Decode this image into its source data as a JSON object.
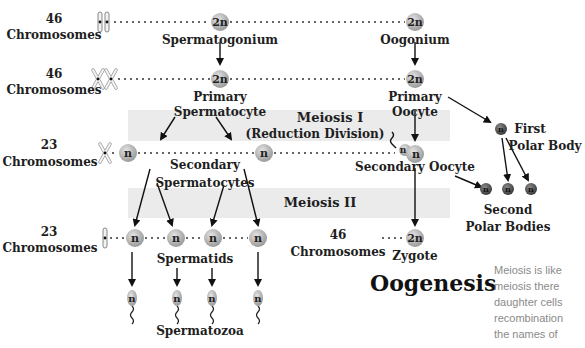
{
  "diagram": {
    "title": "Oogenesis",
    "rows": [
      {
        "count": "46",
        "unit": "Chromosomes"
      },
      {
        "count": "46",
        "unit": "Chromosomes"
      },
      {
        "count": "23",
        "unit": "Chromosomes"
      },
      {
        "count": "23",
        "unit": "Chromosomes"
      }
    ],
    "zygote_row": {
      "count": "46",
      "unit": "Chromosomes"
    },
    "bands": {
      "meiosis1_line1": "Meiosis I",
      "meiosis1_line2": "(Reduction Division)",
      "meiosis2": "Meiosis II"
    },
    "cells": {
      "diploid": "2n",
      "haploid": "n"
    },
    "labels": {
      "spermatogonium": "Spermatogonium",
      "oogonium": "Oogonium",
      "primary": "Primary",
      "spermatocyte": "Spermatocyte",
      "oocyte": "Oocyte",
      "secondary": "Secondary",
      "spermatocytes": "Spermatocytes",
      "secondary_oocyte": "Secondary Oocyte",
      "first": "First",
      "polar_body": "Polar Body",
      "second": "Second",
      "polar_bodies": "Polar Bodies",
      "spermatids": "Spermatids",
      "spermatozoa": "Spermatozoa",
      "zygote": "Zygote"
    },
    "colors": {
      "cell_fill": "#b8b8b8",
      "cell_dark": "#555555",
      "band": "#ebebeb",
      "text": "#1e1e1e"
    }
  },
  "side_text": {
    "lines": [
      "Meiosis is like",
      "meiosis there",
      "daughter cells",
      "recombination",
      "the names of"
    ]
  }
}
